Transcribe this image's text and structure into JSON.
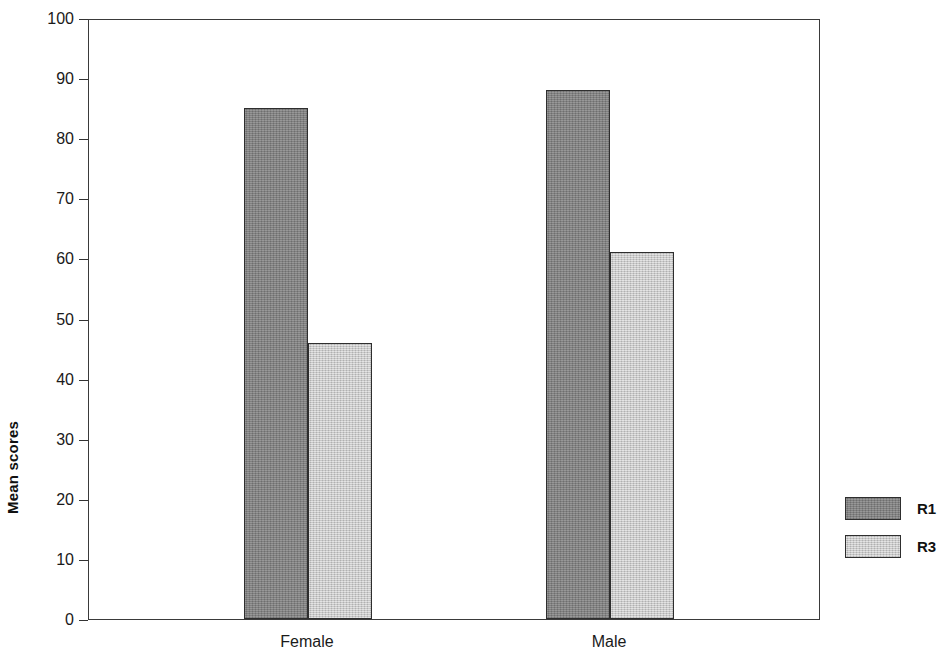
{
  "chart_data": {
    "type": "bar",
    "title": "",
    "subtitle": "",
    "xlabel": "",
    "ylabel": "Mean scores",
    "categories": [
      "Female",
      "Male"
    ],
    "series": [
      {
        "name": "R1",
        "values": [
          85,
          88
        ],
        "color": "#808080"
      },
      {
        "name": "R3",
        "values": [
          46,
          61
        ],
        "color": "#c9c9c9"
      }
    ],
    "ylim": [
      0,
      100
    ],
    "ytick_values": [
      0,
      10,
      20,
      30,
      40,
      50,
      60,
      70,
      80,
      90,
      100
    ],
    "ytick_labels": [
      "0",
      "10",
      "20",
      "30",
      "40",
      "50",
      "60",
      "70",
      "80",
      "90",
      "100"
    ],
    "grid": false,
    "legend_position": "right",
    "bar_border_color": "#2e2e2e",
    "axis_color": "#3a3a3a"
  },
  "axis": {
    "y_title": "Mean scores",
    "ticks": [
      {
        "label": "100",
        "value": 100
      },
      {
        "label": "90",
        "value": 90
      },
      {
        "label": "80",
        "value": 80
      },
      {
        "label": "70",
        "value": 70
      },
      {
        "label": "60",
        "value": 60
      },
      {
        "label": "50",
        "value": 50
      },
      {
        "label": "40",
        "value": 40
      },
      {
        "label": "30",
        "value": 30
      },
      {
        "label": "20",
        "value": 20
      },
      {
        "label": "10",
        "value": 10
      },
      {
        "label": "0",
        "value": 0
      }
    ]
  },
  "categories": [
    {
      "label": "Female"
    },
    {
      "label": "Male"
    }
  ],
  "legend": {
    "items": [
      {
        "label": "R1",
        "color": "#808080"
      },
      {
        "label": "R3",
        "color": "#c9c9c9"
      }
    ]
  }
}
